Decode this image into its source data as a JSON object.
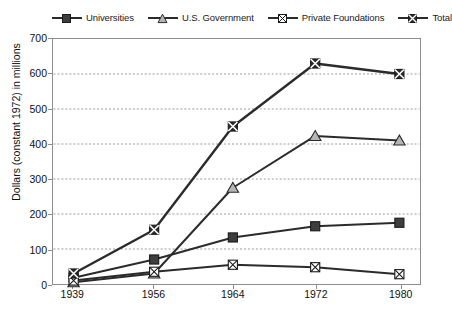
{
  "chart_data": {
    "type": "line",
    "title": "",
    "xlabel": "",
    "ylabel": "Dollars (constant 1972) in millions",
    "categories": [
      "1939",
      "1956",
      "1964",
      "1972",
      "1980"
    ],
    "x": [
      1939,
      1956,
      1964,
      1972,
      1980
    ],
    "ylim": [
      0,
      700
    ],
    "yticks": [
      0,
      100,
      200,
      300,
      400,
      500,
      600,
      700
    ],
    "grid": "horizontal-dotted",
    "legend_position": "top",
    "series": [
      {
        "name": "Universities",
        "marker": "filled-square",
        "color": "#3d3d3d",
        "values": [
          18,
          70,
          133,
          165,
          175
        ]
      },
      {
        "name": "U.S. Government",
        "marker": "triangle",
        "color": "#a8a8a8",
        "values": [
          5,
          30,
          275,
          423,
          410
        ]
      },
      {
        "name": "Private Foundations",
        "marker": "crossed-square",
        "color": "#ffffff",
        "values": [
          10,
          35,
          55,
          48,
          28
        ]
      },
      {
        "name": "Total",
        "marker": "bowtie-square",
        "color": "#2b2b2b",
        "values": [
          30,
          155,
          450,
          630,
          600
        ]
      }
    ]
  },
  "legend": {
    "items": [
      {
        "label": "Universities",
        "icon": "filled-square-marker-icon"
      },
      {
        "label": "U.S. Government",
        "icon": "triangle-marker-icon"
      },
      {
        "label": "Private Foundations",
        "icon": "crossed-square-marker-icon"
      },
      {
        "label": "Total",
        "icon": "bowtie-marker-icon"
      }
    ]
  },
  "axes": {
    "y_title": "Dollars (constant 1972) in millions",
    "y_ticks": [
      "700",
      "600",
      "500",
      "400",
      "300",
      "200",
      "100",
      "0"
    ],
    "x_ticks": [
      "1939",
      "1956",
      "1964",
      "1972",
      "1980"
    ]
  },
  "colors": {
    "line": "#2b2b2b",
    "axis": "#8d8d8d",
    "grid": "#9a9a9a",
    "text": "#1a1a1a"
  }
}
